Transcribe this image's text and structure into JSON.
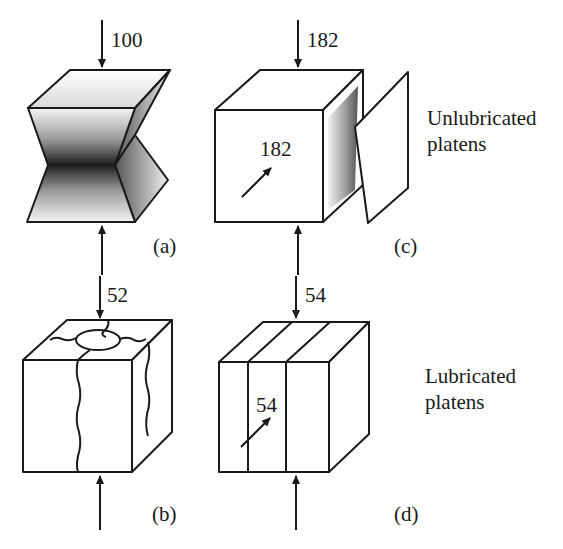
{
  "figure": {
    "panels": [
      {
        "id": "a",
        "label": "(a)",
        "load_top": "100",
        "condition": "unlubricated",
        "failure": "cone/hourglass shear failure"
      },
      {
        "id": "b",
        "label": "(b)",
        "load_top": "52",
        "condition": "lubricated",
        "failure": "vertical cracking"
      },
      {
        "id": "c",
        "label": "(c)",
        "load_top": "182",
        "load_lateral": "182",
        "condition": "unlubricated",
        "failure": "slab spalling"
      },
      {
        "id": "d",
        "label": "(d)",
        "load_top": "54",
        "load_lateral": "54",
        "condition": "lubricated",
        "failure": "vertical splitting into columns"
      }
    ],
    "row_labels": {
      "top_line1": "Unlubricated",
      "top_line2": "platens",
      "bottom_line1": "Lubricated",
      "bottom_line2": "platens"
    }
  },
  "colors": {
    "line": "#1a1a1a",
    "background": "#ffffff",
    "shade_dark": "#2a2a2a"
  }
}
